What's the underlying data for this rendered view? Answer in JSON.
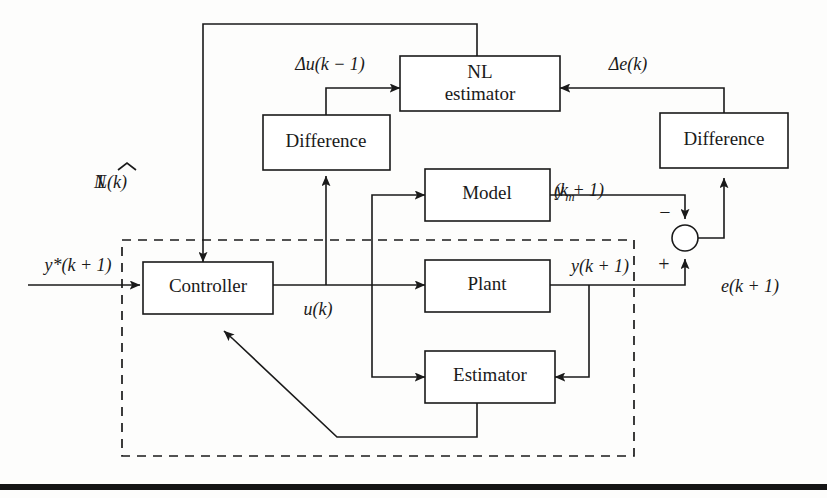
{
  "figure": {
    "type": "block-diagram",
    "background_color": "#fdfdfc",
    "line_color": "#1a1a1a"
  },
  "blocks": [
    {
      "id": "nl_estimator",
      "line1": "NL",
      "line2": "estimator"
    },
    {
      "id": "difference_left",
      "label": "Difference"
    },
    {
      "id": "difference_right",
      "label": "Difference"
    },
    {
      "id": "model",
      "label": "Model"
    },
    {
      "id": "plant",
      "label": "Plant"
    },
    {
      "id": "estimator",
      "label": "Estimator"
    },
    {
      "id": "controller",
      "label": "Controller"
    }
  ],
  "signals": {
    "reference": "y*(k + 1)",
    "delta_u": "Δu(k − 1)",
    "delta_e": "Δe(k)",
    "nl_hat_prefix": "N",
    "nl_hat_suffix": "L(k)",
    "control": "u(k)",
    "model_output_base": "y",
    "model_output_sub": "m",
    "model_output_tail": "(k + 1)",
    "plant_output": "y(k + 1)",
    "error": "e(k + 1)",
    "sum_minus": "−",
    "sum_plus": "+"
  },
  "junction": {
    "name": "summing-junction",
    "minus_sign": "−",
    "plus_sign": "+"
  },
  "dashed_region": {
    "name": "adaptive-control-loop-boundary",
    "style": "dashed"
  },
  "footer_rule": {
    "name": "page-bottom-rule",
    "color": "#151515"
  }
}
